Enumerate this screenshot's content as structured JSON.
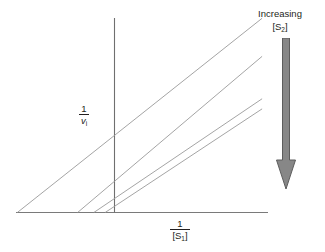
{
  "figure": {
    "type": "lineweaver-burk-plot",
    "background_color": "#ffffff",
    "line_color": "#8a8a8a",
    "axis_color": "#6f6f6f",
    "text_color": "#231f20",
    "arrow_color": "#808080",
    "arrow_outline_color": "#595959"
  },
  "axes": {
    "y_label": {
      "numerator": "1",
      "denominator_symbol": "v",
      "denominator_subscript": "i",
      "full_text": "1 / vᵢ"
    },
    "x_label": {
      "numerator": "1",
      "denominator_symbol": "[S",
      "denominator_subscript": "1",
      "denominator_close": "]",
      "full_text": "1 / [S₁]"
    }
  },
  "annotation": {
    "line1": "Increasing",
    "line2_prefix": "[S",
    "line2_subscript": "2",
    "line2_suffix": "]",
    "full_text": "Increasing [S₂]",
    "arrow_direction": "down",
    "arrow_icon": "down-arrow-icon"
  },
  "chart_data": {
    "type": "line",
    "title": "",
    "subtitle": "",
    "xlabel": "1/[S1]",
    "ylabel": "1/vi",
    "grid": false,
    "legend": null,
    "axis_ticks": [],
    "xlim": [
      -1.0,
      1.0
    ],
    "ylim": [
      0,
      1.0
    ],
    "series": [
      {
        "name": "line-1",
        "order": 1,
        "s2_level": "lowest",
        "x_intercept": -0.395,
        "y_intercept": 0.32,
        "slope": 0.81,
        "x_start": -0.395,
        "x_end": 0.6,
        "y_start": 0.0,
        "y_end": 0.806
      },
      {
        "name": "line-2",
        "order": 2,
        "s2_level": "low",
        "x_intercept": -0.15,
        "y_intercept": 0.108,
        "slope": 0.72,
        "x_start": -0.15,
        "x_end": 0.6,
        "y_start": 0.0,
        "y_end": 0.648
      },
      {
        "name": "line-3",
        "order": 3,
        "s2_level": "high",
        "x_intercept": -0.084,
        "y_intercept": 0.058,
        "slope": 0.69,
        "x_start": -0.084,
        "x_end": 0.6,
        "y_start": 0.0,
        "y_end": 0.472
      },
      {
        "name": "line-4",
        "order": 4,
        "s2_level": "highest",
        "x_intercept": -0.038,
        "y_intercept": 0.026,
        "slope": 0.675,
        "x_start": -0.038,
        "x_end": 0.6,
        "y_start": 0.0,
        "y_end": 0.43
      }
    ]
  }
}
